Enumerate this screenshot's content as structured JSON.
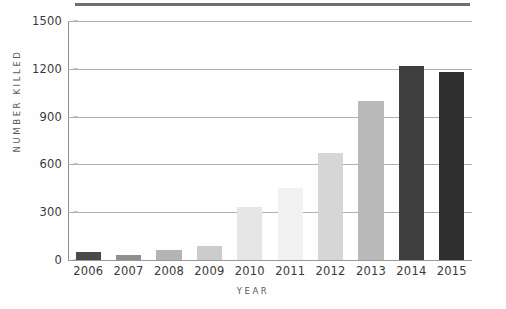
{
  "chart_data": {
    "type": "bar",
    "title": "",
    "xlabel": "YEAR",
    "ylabel": "NUMBER KILLED",
    "categories": [
      "2006",
      "2007",
      "2008",
      "2009",
      "2010",
      "2011",
      "2012",
      "2013",
      "2014",
      "2015"
    ],
    "values": [
      50,
      30,
      65,
      90,
      330,
      450,
      670,
      1000,
      1220,
      1180
    ],
    "bar_colors": [
      "#4a4a4a",
      "#8f8f8f",
      "#b4b4b4",
      "#cccccc",
      "#e6e6e6",
      "#f1f1f1",
      "#d6d6d6",
      "#b9b9b9",
      "#3f3f3f",
      "#2f2f2f"
    ],
    "ylim": [
      0,
      1500
    ],
    "yticks": [
      0,
      300,
      600,
      900,
      1200,
      1500
    ],
    "ytick_labels": [
      "0",
      "300",
      "600",
      "900",
      "1200",
      "1500"
    ],
    "grid": true,
    "legend": "none",
    "axis_color": "#9a9a9a",
    "gridline_color": "#b0b0b0",
    "tick_label_color": "#3a3a3a",
    "axis_title_color": "#5a5a5a",
    "background_color": "#ffffff",
    "top_rule_color": "#6e6e6e"
  }
}
